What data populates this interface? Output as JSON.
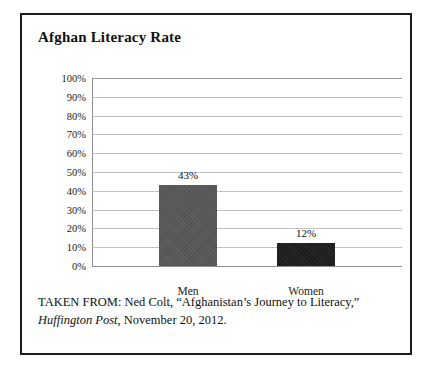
{
  "figure": {
    "title": "Afghan Literacy Rate",
    "caption_line1_prefix": "TAKEN FROM: Ned Colt, “Afghanistan’s Journey to Literacy,”",
    "caption_source_italic": "Huffington Post",
    "caption_line2_rest": ", November 20, 2012.",
    "border_color": "#1b1b1b"
  },
  "chart_data": {
    "type": "bar",
    "title": "Afghan Literacy Rate",
    "categories": [
      "Men",
      "Women"
    ],
    "values": [
      43,
      12
    ],
    "value_labels": [
      "43%",
      "12%"
    ],
    "bar_colors": [
      "#585858",
      "#1d1d1d"
    ],
    "xlabel": "",
    "ylabel": "",
    "ylim": [
      0,
      100
    ],
    "y_tick_step": 10,
    "y_tick_labels": [
      "100%",
      "90%",
      "80%",
      "70%",
      "60%",
      "50%",
      "40%",
      "30%",
      "20%",
      "10%",
      "0%"
    ],
    "y_tick_values": [
      100,
      90,
      80,
      70,
      60,
      50,
      40,
      30,
      20,
      10,
      0
    ],
    "grid": true,
    "grid_axis": "y",
    "grid_color": "#b9b9b9",
    "legend": false,
    "units": "percent"
  }
}
